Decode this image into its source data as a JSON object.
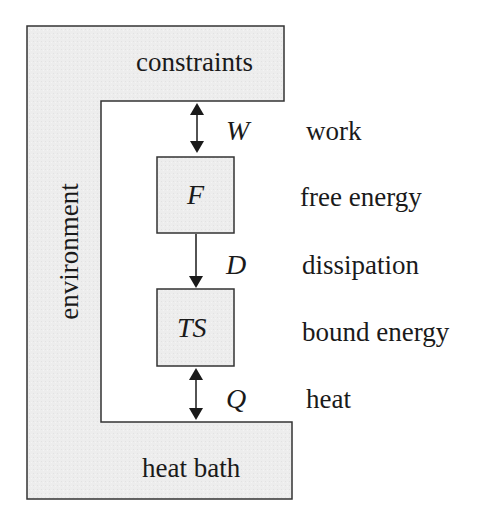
{
  "diagram": {
    "regions": {
      "constraints": "constraints",
      "environment": "environment",
      "heat_bath": "heat bath"
    },
    "nodes": [
      {
        "id": "F",
        "symbol": "F"
      },
      {
        "id": "TS",
        "symbol": "TS"
      }
    ],
    "flows": [
      {
        "symbol": "W",
        "description": "work",
        "direction": "bidirectional"
      },
      {
        "symbol": "D",
        "description": "dissipation",
        "direction": "down"
      },
      {
        "symbol": "Q",
        "description": "heat",
        "direction": "bidirectional"
      }
    ],
    "node_descriptions": {
      "F": "free energy",
      "TS": "bound energy"
    },
    "colors": {
      "fill": "#ededed",
      "stroke": "#333333",
      "arrow": "#1a1a1a",
      "background": "#ffffff"
    }
  }
}
